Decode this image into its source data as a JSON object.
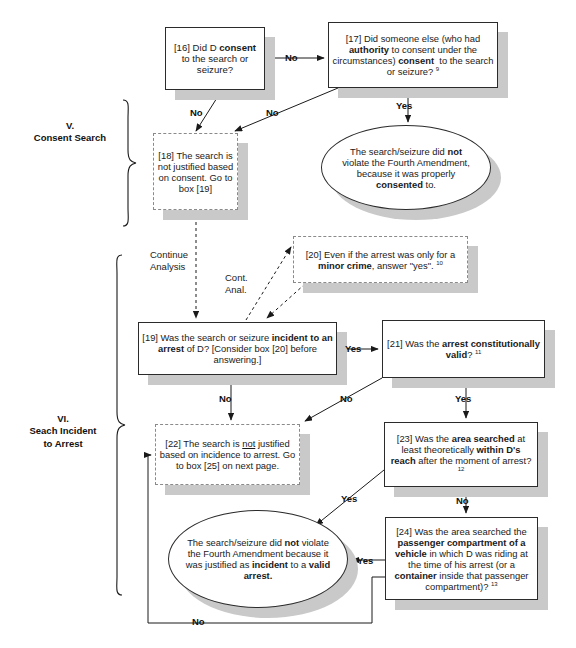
{
  "document": {
    "title": "Fourth Amendment Analysis Flowchart - Consent Search and Search Incident to Arrest"
  },
  "sections": [
    {
      "numeral": "V.",
      "name": "Consent Search"
    },
    {
      "numeral": "VI.",
      "name_line1": "Seach Incident",
      "name_line2": "to Arrest"
    }
  ],
  "nodes": {
    "n16": {
      "id": "[16]",
      "text_html": "[16] Did D <b>consent</b> to the search or seizure?",
      "shape": "box"
    },
    "n17": {
      "id": "[17]",
      "text_html": "[17] Did someone else (who had <b>authority</b> to consent under the circumstances) <b>consent</b>&nbsp; to the search or seizure? <sup>9</sup>",
      "shape": "box"
    },
    "n18": {
      "id": "[18]",
      "text_html": "[18] The search is not justified based on consent. Go to box [19]",
      "shape": "box-dashed"
    },
    "oval_consent": {
      "id": "oval-consent",
      "text_html": "The search/seizure did <b>not</b> violate the Fourth Amendment, because it was properly <b>consented</b> to.",
      "shape": "oval"
    },
    "n20": {
      "id": "[20]",
      "text_html": "[20] Even if the arrest was only for a <b>minor crime</b>, answer \"yes\". <sup>10</sup>",
      "shape": "box-dashed"
    },
    "n19": {
      "id": "[19]",
      "text_html": "[19] Was the search or seizure <b>incident to an arrest</b> of D? [Consider box [20] before answering.]",
      "shape": "box"
    },
    "n21": {
      "id": "[21]",
      "text_html": "[21] Was the <b>arrest constitutionally valid</b>? <sup>11</sup>",
      "shape": "box"
    },
    "n22": {
      "id": "[22]",
      "text_html": "[22] The search is <u>not</u> justified based on incidence to arrest. Go to box [25] on next page.",
      "shape": "box-dashed"
    },
    "n23": {
      "id": "[23]",
      "text_html": "[23] Was the <b>area searched</b> at least theoretically <b>within D's reach</b> after the moment of arrest? <sup>12</sup>",
      "shape": "box"
    },
    "n24": {
      "id": "[24]",
      "text_html": "[24] Was the area searched the <b>passenger compartment of a vehicle</b> in which D was riding at the time of his arrest (or a <b>container</b> inside that passenger compartment)? <sup>13</sup>",
      "shape": "box"
    },
    "oval_arrest": {
      "id": "oval-arrest",
      "text_html": "The search/seizure did <b>not</b> violate the Fourth Amendment because it was justified as <b>incident</b> to a <b>valid arrest.</b>",
      "shape": "oval"
    }
  },
  "edge_labels": {
    "e16_17": "No",
    "e16_18": "No",
    "e17_18": "No",
    "e17_oval": "Yes",
    "e18_19_line1": "Continue",
    "e18_19_line2": "Analysis",
    "e19_20_line1": "Cont.",
    "e19_20_line2": "Anal.",
    "e19_21": "Yes",
    "e19_22": "No",
    "e21_22": "No",
    "e21_23": "Yes",
    "e23_24": "No",
    "e23_oval": "Yes",
    "e24_oval": "Yes",
    "e24_22": "No"
  },
  "colors": {
    "stroke": "#2b2b2b",
    "dashed_stroke": "#8a8a8a",
    "shadow": "#c9c9c9",
    "background": "#ffffff",
    "text": "#1a1a1a"
  }
}
